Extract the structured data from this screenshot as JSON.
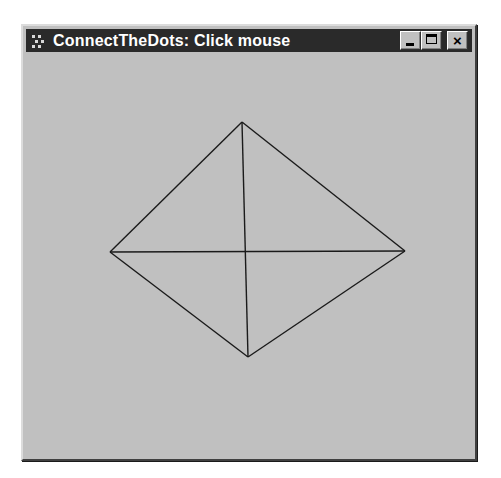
{
  "window": {
    "title": "ConnectTheDots: Click mouse",
    "icon": "application-icon",
    "buttons": {
      "minimize": "minimize",
      "maximize": "maximize",
      "close": "×"
    },
    "colors": {
      "titlebar": "#2a2a2a",
      "title_text": "#ffffff",
      "client_background": "#c0c0c0",
      "line": "#1a1a1a"
    }
  },
  "canvas": {
    "points": [
      {
        "x": 242,
        "y": 122
      },
      {
        "x": 110,
        "y": 252
      },
      {
        "x": 248,
        "y": 357
      },
      {
        "x": 405,
        "y": 251
      }
    ],
    "lines": [
      {
        "from": 0,
        "to": 1
      },
      {
        "from": 0,
        "to": 2
      },
      {
        "from": 0,
        "to": 3
      },
      {
        "from": 1,
        "to": 2
      },
      {
        "from": 1,
        "to": 3
      },
      {
        "from": 2,
        "to": 3
      }
    ]
  }
}
